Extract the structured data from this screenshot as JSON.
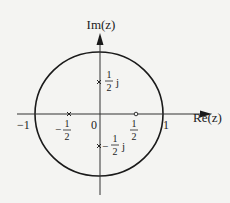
{
  "diagram": {
    "type": "pole-zero plot (z-plane)",
    "axes": {
      "x_label": "Re(z)",
      "y_label": "Im(z)",
      "origin_label": "0"
    },
    "ticks": {
      "neg_one": "−1",
      "one": "1",
      "neg_half_sign": "−",
      "half_num": "1",
      "half_den": "2",
      "j": "j"
    },
    "unit_circle": {
      "radius": 1
    },
    "poles": [
      {
        "re": 0,
        "im": 0.5,
        "marker": "x",
        "label": "1/2 j"
      },
      {
        "re": 0,
        "im": -0.5,
        "marker": "x",
        "label": "-1/2 j"
      },
      {
        "re": -0.5,
        "im": 0,
        "marker": "x",
        "label": "-1/2"
      }
    ],
    "zeros": [
      {
        "re": 0.5,
        "im": 0,
        "marker": "o",
        "label": "1/2"
      }
    ],
    "colors": {
      "line": "#1a1a1a",
      "background": "#f4f4f2"
    }
  }
}
